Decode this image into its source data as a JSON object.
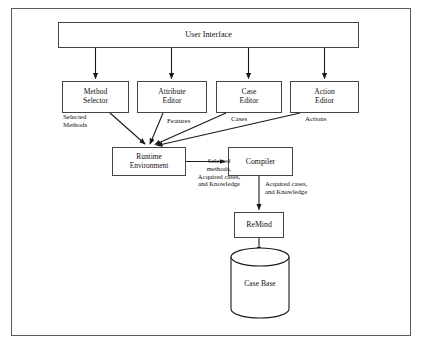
{
  "diagram": {
    "nodes": {
      "user_interface": {
        "label": "User Interface"
      },
      "method_selector": {
        "line1": "Method",
        "line2": "Selector"
      },
      "attribute_editor": {
        "line1": "Attribute",
        "line2": "Editor"
      },
      "case_editor": {
        "line1": "Case",
        "line2": "Editor"
      },
      "action_editor": {
        "line1": "Action",
        "line2": "Editor"
      },
      "runtime_environment": {
        "line1": "Runtime",
        "line2": "Environment"
      },
      "compiler": {
        "label": "Compiler"
      },
      "remind": {
        "label": "ReMind"
      },
      "case_base": {
        "label": "Case Base"
      }
    },
    "edge_labels": {
      "selected_methods": "Selected\nMethods",
      "features": "Features",
      "cases": "Cases",
      "actions": "Actions",
      "selected_methods_acquired": "Selected\nmethods,\nAcquired cases,\nand Knowledge",
      "acquired_cases_knowledge": "Acquired cases,\nand Knowledge"
    },
    "colors": {
      "frame_border": "#5a5a5a",
      "node_border": "#444444",
      "stroke": "#1a1a1a",
      "text": "#111111",
      "background": "#ffffff"
    }
  }
}
